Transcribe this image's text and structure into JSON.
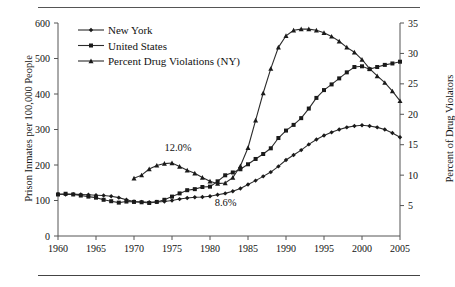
{
  "chart_data": {
    "type": "line",
    "title": "",
    "xlabel": "",
    "ylabel": "Prison Inmates per 100,000 People",
    "y2label": "Percent of Drug Violators",
    "xlim": [
      1960,
      2005
    ],
    "ylim": [
      0,
      600
    ],
    "y2lim": [
      0,
      35
    ],
    "xticks": [
      1960,
      1965,
      1970,
      1975,
      1980,
      1985,
      1990,
      1995,
      2000,
      2005
    ],
    "yticks": [
      0,
      100,
      200,
      300,
      400,
      500,
      600
    ],
    "y2ticks": [
      5,
      10,
      15,
      20,
      25,
      30,
      35
    ],
    "grid": false,
    "legend_position": "top-left",
    "x": [
      1960,
      1961,
      1962,
      1963,
      1964,
      1965,
      1966,
      1967,
      1968,
      1969,
      1970,
      1971,
      1972,
      1973,
      1974,
      1975,
      1976,
      1977,
      1978,
      1979,
      1980,
      1981,
      1982,
      1983,
      1984,
      1985,
      1986,
      1987,
      1988,
      1989,
      1990,
      1991,
      1992,
      1993,
      1994,
      1995,
      1996,
      1997,
      1998,
      1999,
      2000,
      2001,
      2002,
      2003,
      2004,
      2005
    ],
    "series": [
      {
        "name": "New York",
        "marker": "diamond",
        "axis": "left",
        "values": [
          118,
          117,
          118,
          117,
          116,
          115,
          114,
          112,
          108,
          102,
          97,
          96,
          95,
          96,
          97,
          100,
          104,
          107,
          109,
          110,
          112,
          116,
          120,
          126,
          134,
          145,
          156,
          168,
          180,
          196,
          214,
          228,
          242,
          258,
          272,
          283,
          292,
          300,
          306,
          310,
          312,
          310,
          306,
          300,
          290,
          278
        ]
      },
      {
        "name": "United States",
        "marker": "square",
        "axis": "left",
        "values": [
          117,
          119,
          117,
          114,
          111,
          108,
          102,
          98,
          94,
          97,
          96,
          95,
          93,
          96,
          102,
          111,
          120,
          129,
          132,
          138,
          139,
          154,
          171,
          179,
          188,
          202,
          217,
          231,
          247,
          276,
          297,
          313,
          332,
          359,
          389,
          411,
          427,
          444,
          461,
          476,
          478,
          470,
          476,
          482,
          486,
          491
        ]
      },
      {
        "name": "Percent Drug Violations (NY)",
        "marker": "triangle",
        "axis": "right",
        "values": [
          null,
          null,
          null,
          null,
          null,
          null,
          null,
          null,
          null,
          null,
          9.5,
          10.0,
          11.0,
          11.6,
          11.9,
          12.0,
          11.4,
          10.8,
          10.3,
          9.6,
          9.0,
          8.6,
          8.7,
          9.6,
          11.5,
          14.5,
          19.0,
          23.5,
          27.5,
          31.0,
          32.9,
          33.8,
          34.0,
          34.0,
          33.8,
          33.4,
          32.8,
          32.0,
          31.0,
          30.2,
          29.0,
          27.5,
          26.3,
          25.2,
          23.8,
          22.2
        ]
      }
    ],
    "annotations": [
      {
        "text": "12.0%",
        "x": 1975,
        "y_percent": 12.0
      },
      {
        "text": "8.6%",
        "x": 1981,
        "y_percent": 8.6
      }
    ]
  },
  "legend": {
    "items": [
      {
        "label": "New York"
      },
      {
        "label": "United States"
      },
      {
        "label": "Percent Drug Violations (NY)"
      }
    ]
  }
}
